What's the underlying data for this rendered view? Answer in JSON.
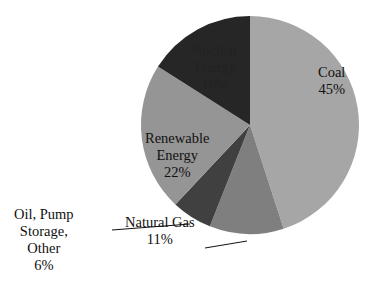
{
  "chart_data": {
    "type": "pie",
    "title": "",
    "start_angle_deg": 0,
    "direction": "clockwise",
    "slices": [
      {
        "label": "Coal",
        "value": 45,
        "display": "45%",
        "color": "#a6a6a6"
      },
      {
        "label": "Natural Gas",
        "value": 11,
        "display": "11%",
        "color": "#7f7f7f"
      },
      {
        "label": "Oil, Pump Storage, Other",
        "value": 6,
        "display": "6%",
        "color": "#404040"
      },
      {
        "label": "Renewable Energy",
        "value": 22,
        "display": "22%",
        "color": "#959595"
      },
      {
        "label": "Nuclear Energy",
        "value": 16,
        "display": "16%",
        "color": "#262626"
      }
    ],
    "legend": "none",
    "data_labels": "category name and percentage"
  },
  "labels": {
    "coal": {
      "line1": "Coal",
      "line2": "45%"
    },
    "natural_gas": {
      "line1": "Natural Gas",
      "line2": "11%"
    },
    "oil": {
      "line1": "Oil, Pump",
      "line2": "Storage,",
      "line3": "Other",
      "line4": "6%"
    },
    "renewable": {
      "line1": "Renewable",
      "line2": "Energy",
      "line3": "22%"
    },
    "nuclear": {
      "line1": "Nuclear",
      "line2": "Energy",
      "line3": "16%"
    }
  }
}
